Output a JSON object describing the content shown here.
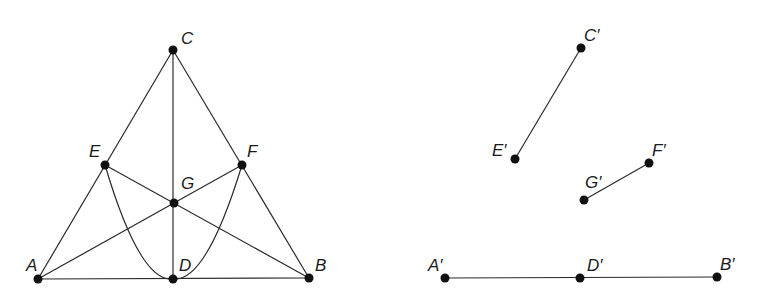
{
  "figure_left": {
    "points": [
      {
        "label": "C",
        "x": 173,
        "y": 50,
        "lx": 181,
        "ly": 44
      },
      {
        "label": "E",
        "x": 105,
        "y": 165,
        "lx": 89,
        "ly": 157
      },
      {
        "label": "F",
        "x": 242,
        "y": 165,
        "lx": 247,
        "ly": 157
      },
      {
        "label": "G",
        "x": 174,
        "y": 203,
        "lx": 181,
        "ly": 189
      },
      {
        "label": "A",
        "x": 38,
        "y": 279,
        "lx": 26,
        "ly": 271
      },
      {
        "label": "D",
        "x": 173,
        "y": 279,
        "lx": 179,
        "ly": 271
      },
      {
        "label": "B",
        "x": 309,
        "y": 278,
        "lx": 315,
        "ly": 271
      }
    ],
    "labels": {
      "C": "C",
      "E": "E",
      "F": "F",
      "G": "G",
      "A": "A",
      "D": "D",
      "B": "B"
    }
  },
  "figure_right": {
    "points": [
      {
        "label": "C′",
        "x": 581,
        "y": 48
      },
      {
        "label": "E′",
        "x": 515,
        "y": 159
      },
      {
        "label": "F′",
        "x": 649,
        "y": 163
      },
      {
        "label": "G′",
        "x": 584,
        "y": 200
      },
      {
        "label": "A′",
        "x": 445,
        "y": 278
      },
      {
        "label": "D′",
        "x": 580,
        "y": 278
      },
      {
        "label": "B′",
        "x": 717,
        "y": 277
      }
    ],
    "labels": {
      "C": "C′",
      "E": "E′",
      "F": "F′",
      "G": "G′",
      "A": "A′",
      "D": "D′",
      "B": "B′"
    }
  }
}
